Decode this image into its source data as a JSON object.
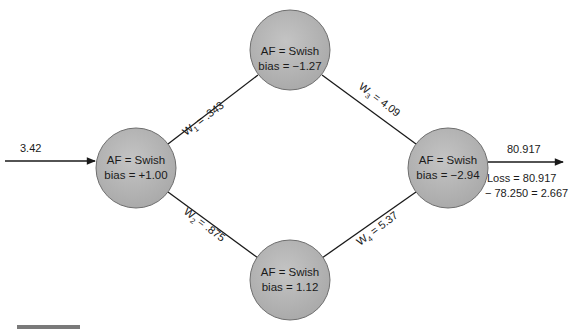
{
  "diagram": {
    "type": "neural-network",
    "input": {
      "value": "3.42"
    },
    "output": {
      "value": "80.917"
    },
    "loss": {
      "line1": "Loss = 80.917",
      "line2": "− 78.250 = 2.667"
    },
    "nodes": [
      {
        "id": "input-node",
        "af": "AF = Swish",
        "bias": "bias = +1.00"
      },
      {
        "id": "hidden-top",
        "af": "AF = Swish",
        "bias": "bias = −1.27"
      },
      {
        "id": "hidden-bottom",
        "af": "AF = Swish",
        "bias": "bias = 1.12"
      },
      {
        "id": "output-node",
        "af": "AF = Swish",
        "bias": "bias = −2.94"
      }
    ],
    "weights": [
      {
        "name": "W",
        "sub": "1",
        "value": " = .343"
      },
      {
        "name": "W",
        "sub": "2",
        "value": " = .875"
      },
      {
        "name": "W",
        "sub": "3",
        "value": " = 4.09"
      },
      {
        "name": "W",
        "sub": "4",
        "value": " = 5.37"
      }
    ],
    "colors": {
      "node_fill": "#b4b4b4",
      "node_stroke": "#6e6e6e",
      "line": "#1a1a1a"
    }
  }
}
